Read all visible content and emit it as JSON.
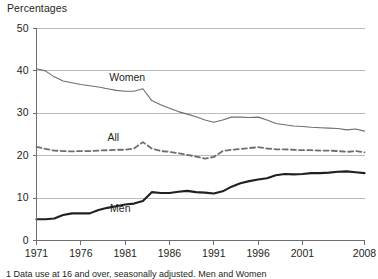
{
  "chart_data": {
    "type": "line",
    "title": "Percentages",
    "xlabel": "",
    "ylabel": "Percentages",
    "xlim": [
      1971,
      2008
    ],
    "ylim": [
      0,
      50
    ],
    "ytick_values": [
      0,
      10,
      20,
      30,
      40,
      50
    ],
    "ytick_labels": [
      "0",
      "10",
      "20",
      "30",
      "40",
      "50"
    ],
    "xtick_values": [
      1971,
      1976,
      1981,
      1986,
      1991,
      1996,
      2001,
      2008
    ],
    "xtick_labels": [
      "1971",
      "1976",
      "1981",
      "1986",
      "1991",
      "1996",
      "2001",
      "2008"
    ],
    "grid": "horizontal",
    "legend_position": "inline-labels",
    "x": [
      1971,
      1972,
      1973,
      1974,
      1975,
      1976,
      1977,
      1978,
      1979,
      1980,
      1981,
      1982,
      1983,
      1984,
      1985,
      1986,
      1987,
      1988,
      1989,
      1990,
      1991,
      1992,
      1993,
      1994,
      1995,
      1996,
      1997,
      1998,
      1999,
      2000,
      2001,
      2002,
      2003,
      2004,
      2005,
      2006,
      2007,
      2008
    ],
    "series": [
      {
        "name": "Women",
        "color": "#6d6e70",
        "style": "solid",
        "width": 1.1,
        "label_x": 1979.2,
        "label_y": 38.3,
        "values": [
          40.5,
          40.0,
          38.6,
          37.6,
          37.2,
          36.8,
          36.5,
          36.2,
          35.8,
          35.4,
          35.2,
          35.2,
          35.8,
          33.0,
          32.0,
          31.2,
          30.4,
          29.8,
          29.2,
          28.4,
          27.9,
          28.4,
          29.1,
          29.1,
          29.0,
          29.1,
          28.4,
          27.6,
          27.3,
          27.0,
          26.9,
          26.7,
          26.6,
          26.5,
          26.4,
          26.1,
          26.3,
          25.8
        ]
      },
      {
        "name": "All",
        "color": "#6d6e70",
        "style": "dashed",
        "width": 1.8,
        "label_x": 1979.0,
        "label_y": 24.1,
        "values": [
          22.1,
          21.6,
          21.2,
          21.1,
          21.0,
          21.1,
          21.1,
          21.2,
          21.3,
          21.4,
          21.4,
          21.7,
          23.2,
          21.7,
          21.1,
          20.9,
          20.6,
          20.2,
          19.8,
          19.3,
          19.7,
          21.1,
          21.4,
          21.6,
          21.8,
          22.0,
          21.7,
          21.5,
          21.5,
          21.4,
          21.3,
          21.3,
          21.2,
          21.2,
          21.1,
          20.9,
          21.1,
          20.8
        ]
      },
      {
        "name": "Men",
        "color": "#231f20",
        "style": "solid",
        "width": 2.1,
        "label_x": 1979.3,
        "label_y": 7.4,
        "values": [
          5.0,
          5.0,
          5.2,
          6.0,
          6.4,
          6.4,
          6.4,
          7.2,
          7.7,
          8.1,
          8.5,
          8.7,
          9.3,
          11.4,
          11.2,
          11.2,
          11.5,
          11.7,
          11.4,
          11.3,
          11.1,
          11.6,
          12.7,
          13.5,
          14.0,
          14.4,
          14.7,
          15.4,
          15.7,
          15.6,
          15.7,
          15.9,
          15.9,
          16.0,
          16.2,
          16.3,
          16.1,
          15.9
        ]
      }
    ],
    "footnote": "1 Data use at 16 and over, seasonally adjusted. Men and Women"
  }
}
